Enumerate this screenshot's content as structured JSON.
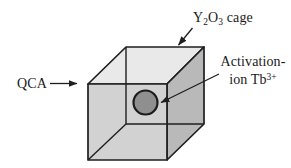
{
  "figure": {
    "background": "#ffffff",
    "labels": {
      "qca": "QCA",
      "cage": {
        "el1": "Y",
        "sub1": "2",
        "el2": "O",
        "sub2": "3",
        "suffix": " cage"
      },
      "activation": {
        "line1": "Activation-",
        "line2": "ion Tb",
        "sup": "3+"
      }
    },
    "colors": {
      "cube_top_face": "#e9e9e9",
      "cube_front_face": "#d2d2d2",
      "cube_right_face": "#b9b9b9",
      "ion_fill": "#8f8f8f",
      "edge": "#1f1f1f",
      "text": "#1a1a1a"
    }
  }
}
